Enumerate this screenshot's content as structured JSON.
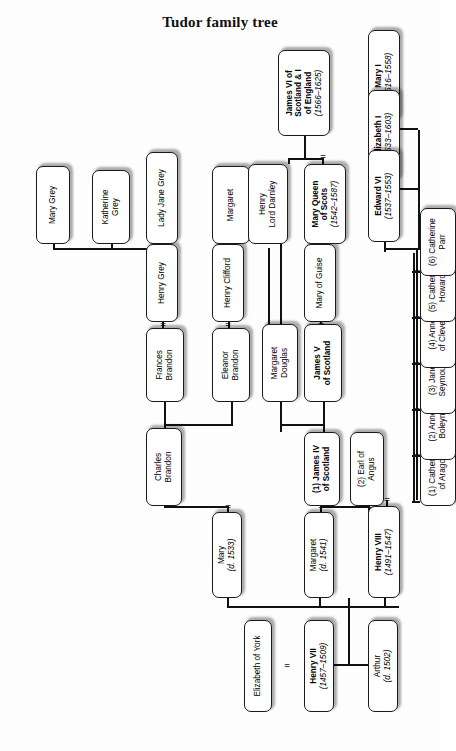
{
  "title": "Tudor family tree",
  "diagram": {
    "type": "family-tree",
    "orientation": "rotated-90-counterclockwise",
    "marriage_symbol": "=",
    "colors": {
      "background": "#fdfdfd",
      "box_fill": "#ffffff",
      "box_border": "#1a1a1a",
      "line": "#111111",
      "text": "#000000"
    },
    "people": [
      {
        "id": "henry7",
        "name": "Henry VII",
        "dates": "(1457–1509)",
        "monarch": true,
        "x": 14,
        "y": 288,
        "w": 92,
        "h": 30
      },
      {
        "id": "elizyork",
        "name": "Elizabeth of York",
        "dates": "",
        "monarch": false,
        "x": 14,
        "y": 228,
        "w": 92,
        "h": 28
      },
      {
        "id": "arthur",
        "name": "Arthur",
        "dates": "(d. 1502)",
        "monarch": false,
        "x": 14,
        "y": 352,
        "w": 92,
        "h": 30
      },
      {
        "id": "henry8",
        "name": "Henry VIII",
        "dates": "(1491–1547)",
        "monarch": true,
        "x": 128,
        "y": 352,
        "w": 92,
        "h": 32
      },
      {
        "id": "margaret",
        "name": "Margaret",
        "dates": "(d. 1541)",
        "monarch": false,
        "x": 128,
        "y": 288,
        "w": 86,
        "h": 30
      },
      {
        "id": "mary1533",
        "name": "Mary",
        "dates": "(d. 1533)",
        "monarch": false,
        "x": 128,
        "y": 196,
        "w": 86,
        "h": 30
      },
      {
        "id": "wife1",
        "name": "(1) Catherine\nof Aragon",
        "dates": "",
        "monarch": false,
        "x": 220,
        "y": 404,
        "w": 68,
        "h": 36
      },
      {
        "id": "wife2",
        "name": "(2) Anne\nBoleyn",
        "dates": "",
        "monarch": false,
        "x": 266,
        "y": 404,
        "w": 68,
        "h": 36
      },
      {
        "id": "wife3",
        "name": "(3) Jane\nSeymour",
        "dates": "",
        "monarch": false,
        "x": 312,
        "y": 404,
        "w": 68,
        "h": 36
      },
      {
        "id": "wife4",
        "name": "(4) Anne\nof Cleves",
        "dates": "",
        "monarch": false,
        "x": 358,
        "y": 404,
        "w": 68,
        "h": 36
      },
      {
        "id": "wife5",
        "name": "(5) Catherine\nHoward",
        "dates": "",
        "monarch": false,
        "x": 404,
        "y": 404,
        "w": 68,
        "h": 36
      },
      {
        "id": "wife6",
        "name": "(6) Catherine\nParr",
        "dates": "",
        "monarch": false,
        "x": 450,
        "y": 404,
        "w": 68,
        "h": 36
      },
      {
        "id": "mary1",
        "name": "Mary I",
        "dates": "(1516–1558)",
        "monarch": true,
        "x": 604,
        "y": 352,
        "w": 92,
        "h": 32
      },
      {
        "id": "elizabeth1",
        "name": "Elizabeth I",
        "dates": "(1533–1603)",
        "monarch": true,
        "x": 544,
        "y": 352,
        "w": 92,
        "h": 32
      },
      {
        "id": "edward6",
        "name": "Edward VI",
        "dates": "(1537–1553)",
        "monarch": true,
        "x": 484,
        "y": 352,
        "w": 92,
        "h": 32
      },
      {
        "id": "james4",
        "name": "(1) James IV\nof Scotland",
        "dates": "",
        "monarch": true,
        "x": 220,
        "y": 288,
        "w": 74,
        "h": 36
      },
      {
        "id": "angus",
        "name": "(2) Earl of\nAngus",
        "dates": "",
        "monarch": false,
        "x": 220,
        "y": 334,
        "w": 74,
        "h": 34
      },
      {
        "id": "charlesbrandon",
        "name": "Charles\nBrandon",
        "dates": "",
        "monarch": false,
        "x": 220,
        "y": 130,
        "w": 78,
        "h": 36
      },
      {
        "id": "james5",
        "name": "James V\nof Scotland",
        "dates": "",
        "monarch": true,
        "x": 324,
        "y": 288,
        "w": 78,
        "h": 38
      },
      {
        "id": "margdouglas",
        "name": "Margaret\nDouglas",
        "dates": "",
        "monarch": false,
        "x": 324,
        "y": 246,
        "w": 78,
        "h": 36
      },
      {
        "id": "eleanorbrandon",
        "name": "Eleanor\nBrandon",
        "dates": "",
        "monarch": false,
        "x": 324,
        "y": 196,
        "w": 74,
        "h": 38
      },
      {
        "id": "francesbrandon",
        "name": "Frances\nBrandon",
        "dates": "",
        "monarch": false,
        "x": 324,
        "y": 130,
        "w": 74,
        "h": 38
      },
      {
        "id": "maryguise",
        "name": "Mary of Guise",
        "dates": "",
        "monarch": false,
        "x": 404,
        "y": 288,
        "w": 78,
        "h": 32
      },
      {
        "id": "henryclifford",
        "name": "Henry Clifford",
        "dates": "",
        "monarch": false,
        "x": 404,
        "y": 196,
        "w": 78,
        "h": 32
      },
      {
        "id": "henrygrey",
        "name": "Henry Grey",
        "dates": "",
        "monarch": false,
        "x": 404,
        "y": 130,
        "w": 78,
        "h": 32
      },
      {
        "id": "maryqos",
        "name": "Mary Queen\nof Scots",
        "dates": "(1542–1587)",
        "monarch": true,
        "x": 482,
        "y": 288,
        "w": 80,
        "h": 42
      },
      {
        "id": "margaret2",
        "name": "Margaret",
        "dates": "",
        "monarch": false,
        "x": 482,
        "y": 196,
        "w": 78,
        "h": 38
      },
      {
        "id": "ladyjane",
        "name": "Lady Jane Grey",
        "dates": "",
        "monarch": false,
        "x": 482,
        "y": 130,
        "w": 92,
        "h": 32
      },
      {
        "id": "katherinegrey",
        "name": "Katherine\nGrey",
        "dates": "",
        "monarch": false,
        "x": 482,
        "y": 76,
        "w": 74,
        "h": 38
      },
      {
        "id": "marygrey",
        "name": "Mary Grey",
        "dates": "",
        "monarch": false,
        "x": 482,
        "y": 20,
        "w": 78,
        "h": 34
      },
      {
        "id": "darnley",
        "name": "Henry\nLord Darnley",
        "dates": "",
        "monarch": false,
        "x": 482,
        "y": 232,
        "w": 80,
        "h": 40
      },
      {
        "id": "james6",
        "name": "James VI of\nScotland & I\nof England",
        "dates": "(1566–1625)",
        "monarch": true,
        "x": 590,
        "y": 262,
        "w": 86,
        "h": 52
      }
    ],
    "marriages": [
      {
        "id": "m-h7-ey",
        "spouse_a": "Henry VII",
        "spouse_b": "Elizabeth of York"
      },
      {
        "id": "m-h8-w1",
        "spouse_a": "Henry VIII",
        "spouse_b": "(1) Catherine of Aragon"
      },
      {
        "id": "m-h8-w2",
        "spouse_a": "Henry VIII",
        "spouse_b": "(2) Anne Boleyn"
      },
      {
        "id": "m-h8-w3",
        "spouse_a": "Henry VIII",
        "spouse_b": "(3) Jane Seymour"
      },
      {
        "id": "m-h8-w4",
        "spouse_a": "Henry VIII",
        "spouse_b": "(4) Anne of Cleves"
      },
      {
        "id": "m-h8-w5",
        "spouse_a": "Henry VIII",
        "spouse_b": "(5) Catherine Howard"
      },
      {
        "id": "m-h8-w6",
        "spouse_a": "Henry VIII",
        "spouse_b": "(6) Catherine Parr"
      },
      {
        "id": "m-mg-j4",
        "spouse_a": "Margaret",
        "spouse_b": "(1) James IV of Scotland"
      },
      {
        "id": "m-mg-ang",
        "spouse_a": "Margaret",
        "spouse_b": "(2) Earl of Angus"
      },
      {
        "id": "m-mary-cb",
        "spouse_a": "Mary",
        "spouse_b": "Charles Brandon"
      },
      {
        "id": "m-j5-mog",
        "spouse_a": "James V of Scotland",
        "spouse_b": "Mary of Guise"
      },
      {
        "id": "m-eb-hc",
        "spouse_a": "Eleanor Brandon",
        "spouse_b": "Henry Clifford"
      },
      {
        "id": "m-fb-hg",
        "spouse_a": "Frances Brandon",
        "spouse_b": "Henry Grey"
      },
      {
        "id": "m-mqs-hd",
        "spouse_a": "Mary Queen of Scots",
        "spouse_b": "Henry Lord Darnley"
      }
    ]
  }
}
